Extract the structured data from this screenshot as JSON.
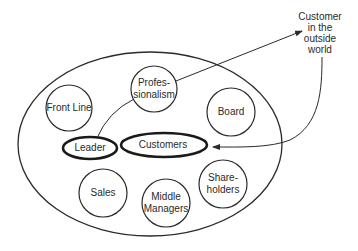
{
  "diagram": {
    "outer_group": {
      "label": ""
    },
    "nodes": [
      {
        "id": "professionalism",
        "lines": [
          "Profes-",
          "sionalism"
        ],
        "shape": "circle"
      },
      {
        "id": "front-line",
        "lines": [
          "Front Line"
        ],
        "shape": "circle"
      },
      {
        "id": "board",
        "lines": [
          "Board"
        ],
        "shape": "circle"
      },
      {
        "id": "leader",
        "lines": [
          "Leader"
        ],
        "shape": "bold-ellipse"
      },
      {
        "id": "customers",
        "lines": [
          "Customers"
        ],
        "shape": "bold-ellipse"
      },
      {
        "id": "sales",
        "lines": [
          "Sales"
        ],
        "shape": "circle"
      },
      {
        "id": "middle-managers",
        "lines": [
          "Middle",
          "Managers"
        ],
        "shape": "circle"
      },
      {
        "id": "shareholders",
        "lines": [
          "Share-",
          "holders"
        ],
        "shape": "circle"
      }
    ],
    "external": {
      "id": "customer-outside",
      "lines": [
        "Customer",
        "in the",
        "outside",
        "world"
      ]
    },
    "edges": [
      {
        "from": "leader",
        "to": "professionalism",
        "type": "line"
      },
      {
        "from": "professionalism",
        "to": "customer-outside",
        "type": "arrow"
      },
      {
        "from": "customer-outside",
        "to": "customers",
        "type": "curved-arrow"
      }
    ],
    "colors": {
      "stroke": "#2a2a2a",
      "background": "#ffffff",
      "text": "#2a2a2a"
    }
  }
}
